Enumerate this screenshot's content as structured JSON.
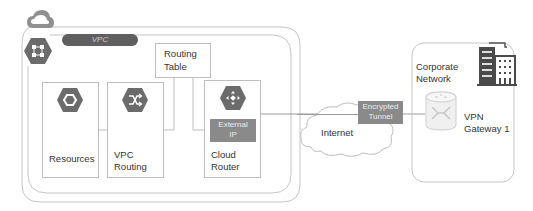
{
  "gcp_cloud": {
    "icon": "cloud-icon",
    "vpc": {
      "label": "VPC",
      "icon": "vpc-network-hexagon-icon",
      "routing_table": {
        "line1": "Routing",
        "line2": "Table"
      },
      "nodes": [
        {
          "id": "resources",
          "line1": "Resources",
          "line2": "",
          "icon": "compute-engine-hexagon-icon"
        },
        {
          "id": "vpc-routing",
          "line1": "VPC",
          "line2": "Routing",
          "icon": "routes-shuffle-hexagon-icon"
        },
        {
          "id": "cloud-router",
          "line1": "Cloud",
          "line2": "Router",
          "icon": "cloud-router-hexagon-icon",
          "external_ip": {
            "line1": "External",
            "line2": "IP"
          }
        }
      ]
    }
  },
  "internet": {
    "label": "Internet",
    "icon": "internet-cloud-icon"
  },
  "tunnel": {
    "line1": "Encrypted",
    "line2": "Tunnel"
  },
  "corporate": {
    "line1": "Corporate",
    "line2": "Network",
    "building_icon": "building-icon",
    "gateway": {
      "line1": "VPN",
      "line2": "Gateway 1",
      "icon": "vpn-gateway-icon"
    }
  },
  "colors": {
    "hexagon": "#6b6b6b",
    "pill": "#5f5f5f",
    "label_box": "#8a8a8a",
    "border": "#bdbdbd",
    "text": "#333333"
  }
}
